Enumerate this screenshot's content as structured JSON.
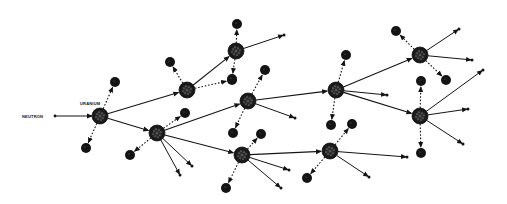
{
  "labels": {
    "neutron": "NEUTRON",
    "uranium": "URANIUM"
  },
  "colors": {
    "ink": "#141414",
    "background": "#ffffff"
  },
  "incoming_neutron": {
    "from": [
      55,
      116
    ],
    "to": [
      92,
      116
    ]
  },
  "nuclei": [
    {
      "id": "A",
      "x": 100,
      "y": 116
    },
    {
      "id": "B",
      "x": 187,
      "y": 90
    },
    {
      "id": "C",
      "x": 157,
      "y": 133
    },
    {
      "id": "D",
      "x": 236,
      "y": 51
    },
    {
      "id": "E",
      "x": 248,
      "y": 101
    },
    {
      "id": "F",
      "x": 242,
      "y": 155
    },
    {
      "id": "G",
      "x": 336,
      "y": 90
    },
    {
      "id": "H",
      "x": 420,
      "y": 55
    },
    {
      "id": "I",
      "x": 330,
      "y": 151
    },
    {
      "id": "J",
      "x": 420,
      "y": 116
    }
  ],
  "fragments": [
    {
      "from": "A",
      "x": 115,
      "y": 82
    },
    {
      "from": "A",
      "x": 86,
      "y": 148
    },
    {
      "from": "B",
      "x": 170,
      "y": 62
    },
    {
      "from": "B",
      "x": 232,
      "y": 80
    },
    {
      "from": "C",
      "x": 185,
      "y": 113
    },
    {
      "from": "C",
      "x": 130,
      "y": 155
    },
    {
      "from": "D",
      "x": 237,
      "y": 24
    },
    {
      "from": "D",
      "x": 232,
      "y": 79
    },
    {
      "from": "E",
      "x": 265,
      "y": 70
    },
    {
      "from": "E",
      "x": 233,
      "y": 133
    },
    {
      "from": "F",
      "x": 261,
      "y": 134
    },
    {
      "from": "F",
      "x": 226,
      "y": 188
    },
    {
      "from": "G",
      "x": 346,
      "y": 55
    },
    {
      "from": "G",
      "x": 331,
      "y": 125
    },
    {
      "from": "H",
      "x": 396,
      "y": 31
    },
    {
      "from": "H",
      "x": 446,
      "y": 80
    },
    {
      "from": "I",
      "x": 352,
      "y": 124
    },
    {
      "from": "I",
      "x": 307,
      "y": 178
    },
    {
      "from": "J",
      "x": 421,
      "y": 81
    },
    {
      "from": "J",
      "x": 421,
      "y": 153
    }
  ],
  "neutron_paths": [
    {
      "from": "A",
      "to": "B"
    },
    {
      "from": "A",
      "to": "C"
    },
    {
      "from": "B",
      "to": "D"
    },
    {
      "from": "C",
      "to": "E"
    },
    {
      "from": "C",
      "to": "F"
    },
    {
      "from": "E",
      "to": "G"
    },
    {
      "from": "G",
      "to": "H"
    },
    {
      "from": "F",
      "to": "I"
    },
    {
      "from": "G",
      "to": "J"
    }
  ],
  "free_neutrons": [
    {
      "from": "C",
      "x": 180,
      "y": 175
    },
    {
      "from": "C",
      "x": 192,
      "y": 166
    },
    {
      "from": "D",
      "x": 284,
      "y": 35
    },
    {
      "from": "E",
      "x": 295,
      "y": 118
    },
    {
      "from": "F",
      "x": 289,
      "y": 170
    },
    {
      "from": "F",
      "x": 281,
      "y": 188
    },
    {
      "from": "G",
      "x": 387,
      "y": 95
    },
    {
      "from": "H",
      "x": 459,
      "y": 29
    },
    {
      "from": "H",
      "x": 472,
      "y": 60
    },
    {
      "from": "I",
      "x": 407,
      "y": 157
    },
    {
      "from": "I",
      "x": 369,
      "y": 177
    },
    {
      "from": "J",
      "x": 483,
      "y": 70
    },
    {
      "from": "J",
      "x": 468,
      "y": 109
    },
    {
      "from": "J",
      "x": 463,
      "y": 144
    }
  ]
}
